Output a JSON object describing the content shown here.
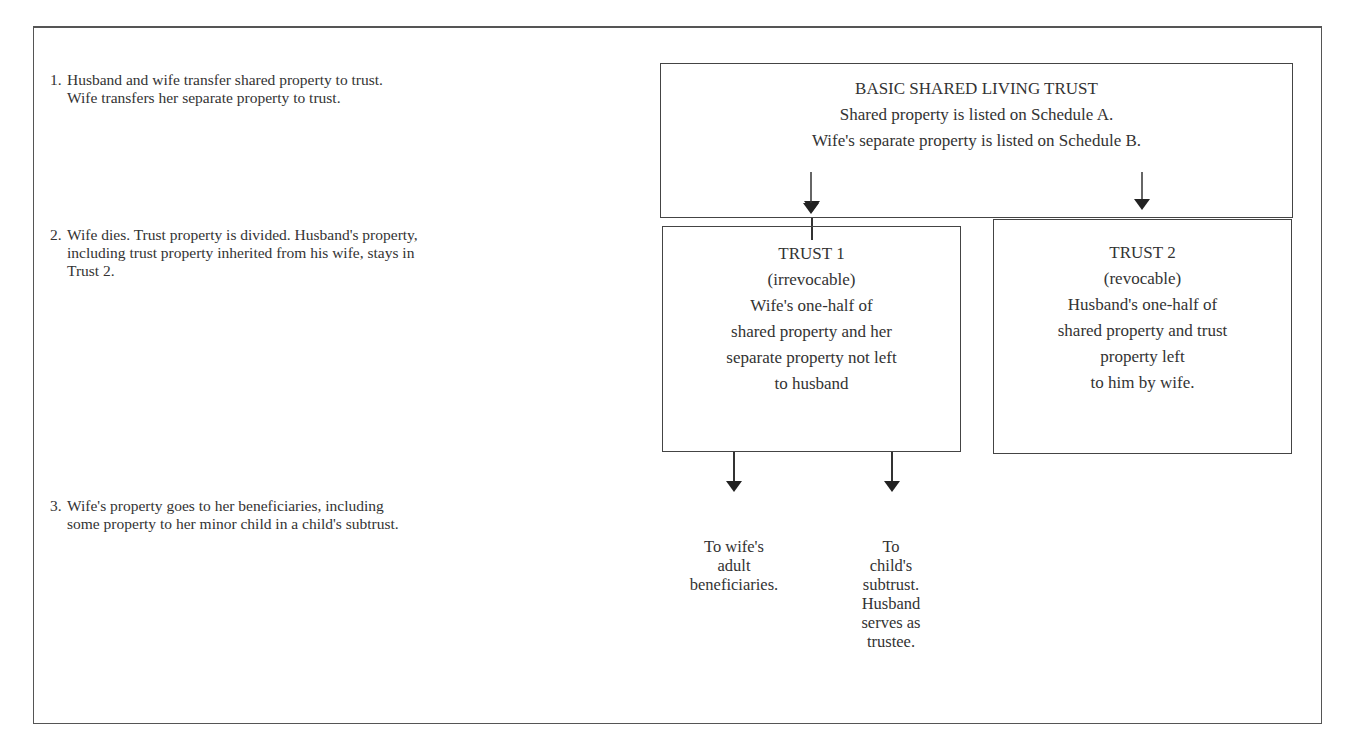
{
  "steps": [
    {
      "number": "1.",
      "lines": [
        "Husband and wife transfer shared property to trust.",
        "Wife transfers her separate property to trust."
      ]
    },
    {
      "number": "2.",
      "lines": [
        "Wife dies. Trust property is divided. Husband's property,",
        "including trust property inherited from his wife, stays in",
        "Trust 2."
      ]
    },
    {
      "number": "3.",
      "lines": [
        "Wife's property goes to her beneficiaries, including",
        "some property to her minor child in a child's subtrust."
      ]
    }
  ],
  "diagram": {
    "root": {
      "title": "BASIC SHARED LIVING TRUST",
      "lines": [
        "Shared property is listed on Schedule A.",
        "Wife's separate property is listed on Schedule B."
      ]
    },
    "trust1": {
      "title": "TRUST 1",
      "subtitle": "(irrevocable)",
      "lines": [
        "Wife's one-half of",
        "shared property and her",
        "separate property not left",
        "to husband"
      ]
    },
    "trust2": {
      "title": "TRUST 2",
      "subtitle": "(revocable)",
      "lines": [
        "Husband's one-half of",
        "shared property and trust",
        "property left",
        "to him by wife."
      ]
    },
    "leaves": [
      {
        "lines": [
          "To wife's",
          "adult",
          "beneficiaries."
        ]
      },
      {
        "lines": [
          "To",
          "child's",
          "subtrust.",
          "Husband",
          "serves as",
          "trustee."
        ]
      }
    ]
  }
}
